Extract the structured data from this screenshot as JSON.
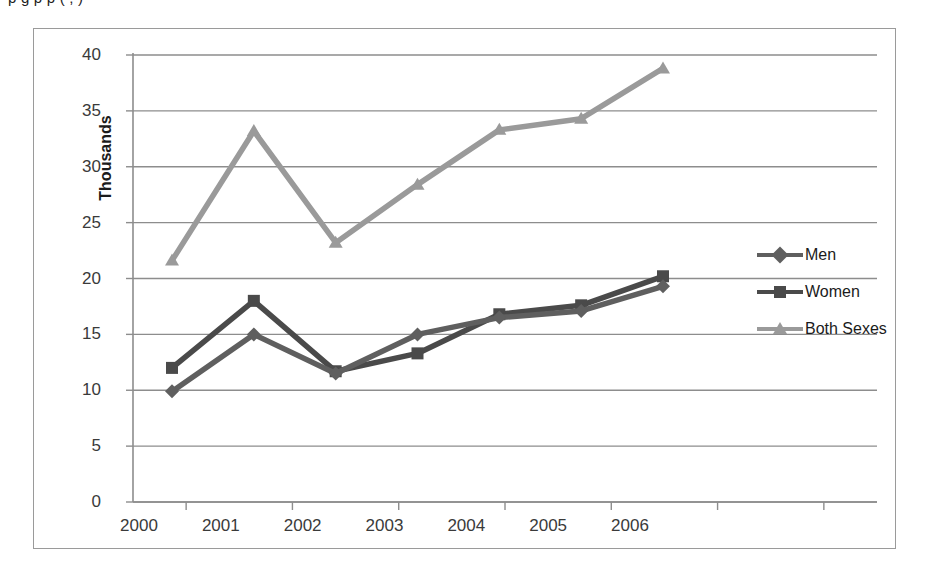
{
  "page": {
    "clipped_top_text": "p                 g     p         p                   (              ,              )"
  },
  "legend": {
    "position": "right",
    "items": [
      {
        "label": "Men",
        "marker": "diamond",
        "color": "#5f5f5f"
      },
      {
        "label": "Women",
        "marker": "square",
        "color": "#4a4a4a"
      },
      {
        "label": "Both Sexes",
        "marker": "triangle",
        "color": "#9a9a9a"
      }
    ]
  },
  "chart_data": {
    "type": "line",
    "title": "",
    "xlabel": "",
    "ylabel": "Thousands",
    "ylim": [
      0,
      40
    ],
    "ytick_step": 5,
    "yticks": [
      "40",
      "35",
      "30",
      "25",
      "20",
      "15",
      "10",
      "5",
      "0"
    ],
    "categories": [
      "2000",
      "2001",
      "2002",
      "2003",
      "2004",
      "2005",
      "2006"
    ],
    "grid": true,
    "series": [
      {
        "name": "Men",
        "marker": "diamond",
        "color": "#5f5f5f",
        "values": [
          9.9,
          15.0,
          11.5,
          15.0,
          16.5,
          17.1,
          19.3
        ]
      },
      {
        "name": "Women",
        "marker": "square",
        "color": "#4a4a4a",
        "values": [
          12.0,
          18.0,
          11.7,
          13.3,
          16.8,
          17.6,
          20.2
        ]
      },
      {
        "name": "Both Sexes",
        "marker": "triangle",
        "color": "#9a9a9a",
        "values": [
          21.6,
          33.2,
          23.2,
          28.4,
          33.3,
          34.3,
          38.8
        ]
      }
    ]
  }
}
